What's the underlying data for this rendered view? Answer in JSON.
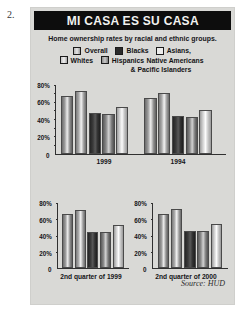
{
  "figure_number": "2.",
  "headline": "MI CASA ES SU CASA",
  "subhead": "Home ownership rates by racial and ethnic groups.",
  "legend": {
    "items": [
      {
        "label": "Overall",
        "swatch": "overall-swatch"
      },
      {
        "label": "Blacks",
        "swatch": "blacks-swatch"
      },
      {
        "label": "Asians,",
        "swatch": "asians-swatch"
      },
      {
        "label": "Whites",
        "swatch": "whites-swatch"
      },
      {
        "label": "Hispanics",
        "swatch": "hispanics-swatch"
      }
    ],
    "continuation_line_1": "Native Americans",
    "continuation_line_2": "& Pacific Islanders"
  },
  "source": "Source: HUD",
  "chart_data": [
    {
      "type": "bar",
      "id": "top-chart",
      "title": "MI CASA ES SU CASA",
      "subtitle": "Home ownership rates by racial and ethnic groups.",
      "categories": [
        "1999",
        "1994"
      ],
      "series": [
        {
          "name": "Overall",
          "values": [
            67,
            64
          ]
        },
        {
          "name": "Whites",
          "values": [
            73,
            70
          ]
        },
        {
          "name": "Blacks",
          "values": [
            47,
            43
          ]
        },
        {
          "name": "Hispanics",
          "values": [
            46,
            42
          ]
        },
        {
          "name": "Asians, Native Americans & Pacific Islanders",
          "values": [
            54,
            51
          ]
        }
      ],
      "yticks": [
        "80%",
        "60%",
        "40%",
        "20%",
        "0"
      ],
      "ylim": [
        0,
        80
      ],
      "xlabel": "",
      "ylabel": "",
      "grid": false,
      "legend_position": "top"
    },
    {
      "type": "bar",
      "id": "bottom-left-chart",
      "categories": [
        "2nd quarter of 1999"
      ],
      "series": [
        {
          "name": "Overall",
          "values": [
            66
          ]
        },
        {
          "name": "Whites",
          "values": [
            72
          ]
        },
        {
          "name": "Blacks",
          "values": [
            44
          ]
        },
        {
          "name": "Hispanics",
          "values": [
            44
          ]
        },
        {
          "name": "Asians, Native Americans & Pacific Islanders",
          "values": [
            53
          ]
        }
      ],
      "yticks": [
        "80%",
        "60%",
        "40%",
        "20%",
        "0"
      ],
      "ylim": [
        0,
        80
      ],
      "grid": false
    },
    {
      "type": "bar",
      "id": "bottom-right-chart",
      "categories": [
        "2nd quarter of 2000"
      ],
      "series": [
        {
          "name": "Overall",
          "values": [
            66
          ]
        },
        {
          "name": "Whites",
          "values": [
            73
          ]
        },
        {
          "name": "Blacks",
          "values": [
            46
          ]
        },
        {
          "name": "Hispanics",
          "values": [
            45
          ]
        },
        {
          "name": "Asians, Native Americans & Pacific Islanders",
          "values": [
            54
          ]
        }
      ],
      "yticks": [
        "80%",
        "60%",
        "40%",
        "20%",
        "0"
      ],
      "ylim": [
        0,
        80
      ],
      "grid": false
    }
  ]
}
